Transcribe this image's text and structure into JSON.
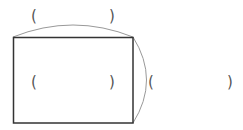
{
  "diagram": {
    "type": "rectangle-with-measurement-arcs",
    "rectangle": {
      "x": 13,
      "y": 37,
      "width": 120,
      "height": 86,
      "stroke": "#333333"
    },
    "arc_color": "#999999",
    "labels": {
      "top_open": "(",
      "top_close": ")",
      "inner_open": "(",
      "inner_close": ")",
      "right_open": "(",
      "right_close": ")"
    },
    "text_color": "#555555"
  }
}
